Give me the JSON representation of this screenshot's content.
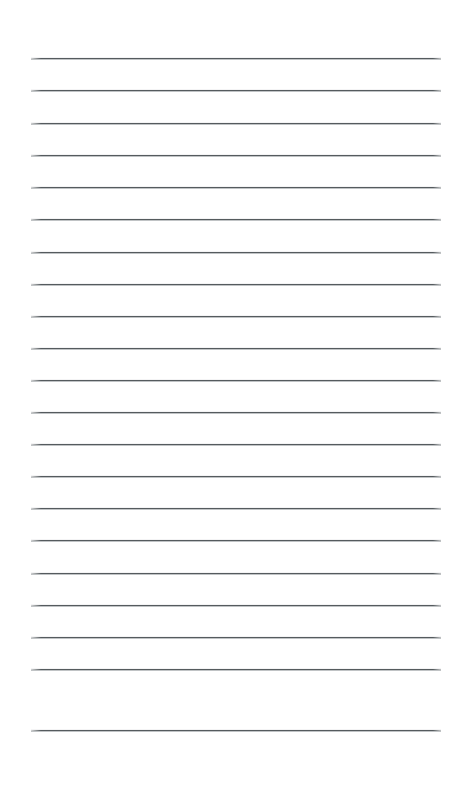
{
  "document": {
    "kind": "lined-paper",
    "title": "Lined Paper Sheet",
    "page_width_px": 459,
    "page_height_px": 793,
    "background_color": "#ffffff",
    "content_text": "",
    "rules": {
      "count": 21,
      "color": "#555b5e",
      "highlight_color": "#8c9196",
      "thickness_px": 1,
      "left_x_px": 31,
      "right_x_px": 441,
      "length_px": 410,
      "first_y_px": 58,
      "spacing_px": 32.3,
      "y_positions": [
        58,
        90,
        123,
        155,
        187,
        219,
        252,
        284,
        316,
        348,
        380,
        412,
        444,
        476,
        508,
        540,
        573,
        605,
        637,
        669,
        730
      ]
    },
    "margins": {
      "top_px": 58,
      "bottom_px": 63,
      "left_px": 31,
      "right_px": 18
    },
    "line_labels": [
      "line-1",
      "line-2",
      "line-3",
      "line-4",
      "line-5",
      "line-6",
      "line-7",
      "line-8",
      "line-9",
      "line-10",
      "line-11",
      "line-12",
      "line-13",
      "line-14",
      "line-15",
      "line-16",
      "line-17",
      "line-18",
      "line-19",
      "line-20",
      "line-21"
    ]
  }
}
